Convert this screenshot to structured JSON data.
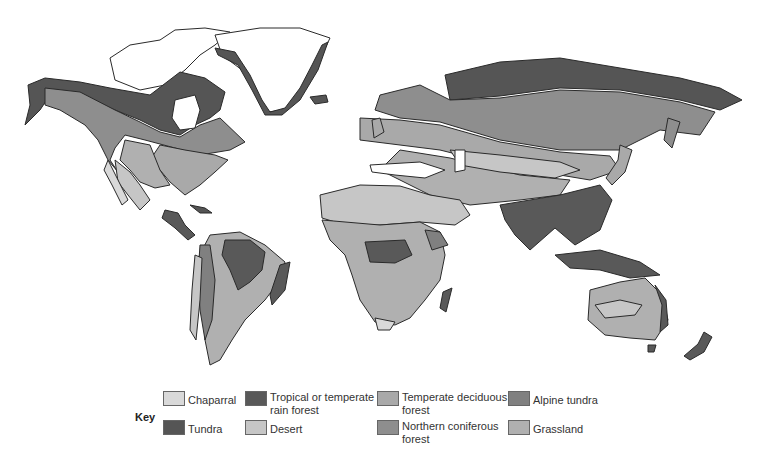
{
  "map": {
    "subject": "World biomes",
    "colors": {
      "ocean": "#ffffff",
      "ice": "#ffffff",
      "outline": "#2a2a2a"
    }
  },
  "legend": {
    "title": "Key",
    "items": [
      {
        "label": "Chaparral",
        "color": "#d9d9d9"
      },
      {
        "label": "Tropical or temperate rain forest",
        "color": "#595959"
      },
      {
        "label": "Temperate deciduous forest",
        "color": "#a9a9a9"
      },
      {
        "label": "Alpine tundra",
        "color": "#808080"
      },
      {
        "label": "Tundra",
        "color": "#555555"
      },
      {
        "label": "Desert",
        "color": "#c6c6c6"
      },
      {
        "label": "Northern coniferous forest",
        "color": "#8e8e8e"
      },
      {
        "label": "Grassland",
        "color": "#b0b0b0"
      }
    ]
  }
}
